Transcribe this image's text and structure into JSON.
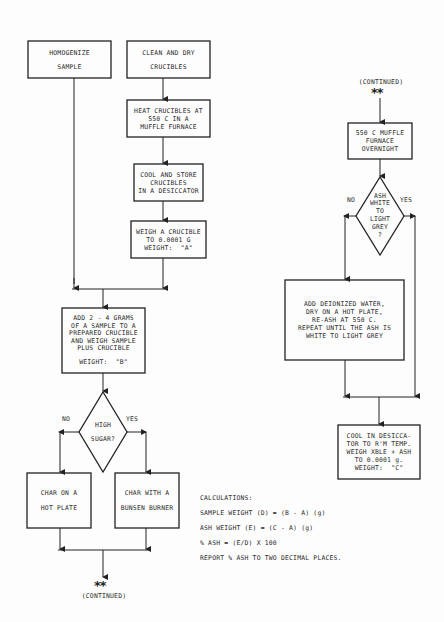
{
  "flowchart": {
    "left": {
      "homogenize": [
        "HOMOGENIZE",
        "SAMPLE"
      ],
      "clean_dry": [
        "CLEAN AND DRY",
        "CRUCIBLES"
      ],
      "heat": [
        "HEAT CRUCIBLES AT",
        "550 C IN A",
        "MUFFLE FURNACE"
      ],
      "cool_store": [
        "COOL AND STORE",
        "CRUCIBLES",
        "IN A DESICCATOR"
      ],
      "weigh_crucible": [
        "WEIGH A CRUCIBLE",
        "TO 0.0001 G",
        "WEIGHT:  \"A\""
      ],
      "add_sample": [
        "ADD 2 - 4 GRAMS",
        "OF A SAMPLE TO A",
        "PREPARED CRUCIBLE",
        "AND WEIGH SAMPLE",
        "PLUS CRUCIBLE",
        "",
        "WEIGHT:  \"B\""
      ],
      "decision": {
        "text": [
          "HIGH",
          "SUGAR?"
        ],
        "no_label": "NO",
        "yes_label": "YES"
      },
      "char_hot_plate": [
        "CHAR ON A",
        "HOT PLATE"
      ],
      "char_bunsen": [
        "CHAR WITH A",
        "BUNSEN BURNER"
      ],
      "continued_marker": "**",
      "continued_label": "(CONTINUED)"
    },
    "right": {
      "continued_label": "(CONTINUED)",
      "continued_marker": "**",
      "muffle": [
        "550 C MUFFLE",
        "FURNACE",
        "OVERNIGHT"
      ],
      "decision": {
        "text": [
          "ASH",
          "WHITE",
          "TO",
          "LIGHT",
          "GREY",
          "?"
        ],
        "no_label": "NO",
        "yes_label": "YES"
      },
      "reash": [
        "ADD DEIONIZED WATER,",
        "DRY ON A HOT PLATE,",
        "RE-ASH AT 550 C.",
        "REPEAT UNTIL THE ASH IS",
        "WHITE TO LIGHT GREY"
      ],
      "cool_weigh": [
        "COOL IN DESICCA-",
        "TOR TO R'M TEMP.",
        "WEIGH XBLE + ASH",
        "TO 0.0001 g.",
        "WEIGHT:  \"C\""
      ]
    }
  },
  "calculations": {
    "title": "CALCULATIONS:",
    "lines": [
      "SAMPLE WEIGHT (D) = (B - A) (g)",
      "ASH WEIGHT (E) = (C - A) (g)",
      "% ASH = (E/D) X 100",
      "REPORT % ASH TO TWO DECIMAL PLACES."
    ]
  }
}
